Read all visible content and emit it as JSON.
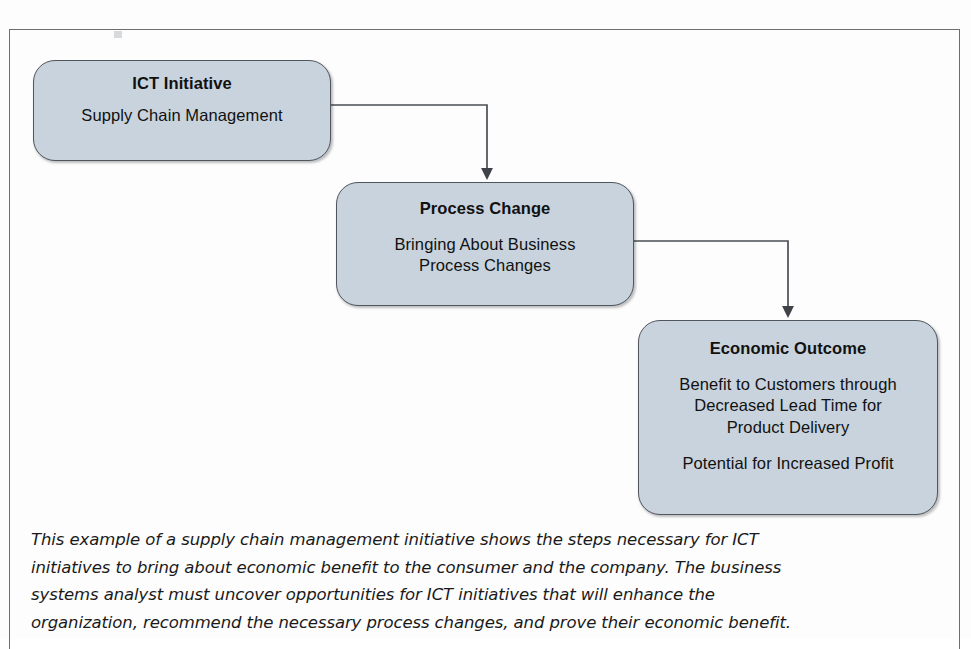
{
  "figure": {
    "type": "flowchart",
    "orientation": "cascading-left-to-right-downward",
    "frame_visible": true,
    "colors": {
      "box_fill": "#c8d3dd",
      "box_border": "#51555c",
      "connector": "#4a4e54",
      "text": "#111111",
      "frame": "#6e6e72",
      "page_background": "#fdfdfd"
    },
    "nodes": [
      {
        "id": "ict-initiative",
        "title": "ICT Initiative",
        "lines": [
          "Supply Chain Management"
        ],
        "lines2": []
      },
      {
        "id": "process-change",
        "title": "Process Change",
        "lines": [
          "Bringing About Business",
          "Process Changes"
        ],
        "lines2": []
      },
      {
        "id": "economic-outcome",
        "title": "Economic Outcome",
        "lines": [
          "Benefit to Customers through",
          "Decreased Lead Time for",
          "Product Delivery"
        ],
        "lines2": [
          "Potential for Increased Profit"
        ]
      }
    ],
    "edges": [
      {
        "id": "edge-ict-to-process",
        "from": "ict-initiative",
        "to": "process-change",
        "style": "elbow",
        "arrowhead": "solid-triangle"
      },
      {
        "id": "edge-process-to-outcome",
        "from": "process-change",
        "to": "economic-outcome",
        "style": "elbow",
        "arrowhead": "solid-triangle"
      }
    ]
  },
  "caption": {
    "lines": [
      "This example of a supply chain management initiative shows the steps necessary for ICT",
      "initiatives to bring about economic benefit to the consumer and the company. The business",
      "systems analyst must uncover opportunities for ICT initiatives that will enhance the",
      "organization, recommend the necessary process changes, and prove their economic benefit."
    ]
  }
}
